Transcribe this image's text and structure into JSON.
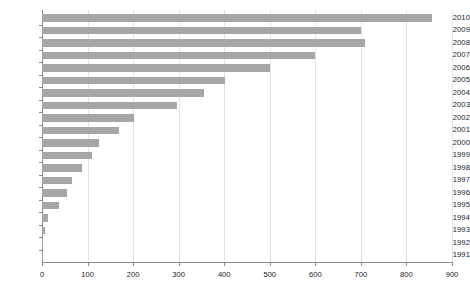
{
  "chart_data": {
    "type": "bar",
    "orientation": "horizontal",
    "title": "",
    "subtitle": "",
    "xlabel": "",
    "ylabel": "",
    "categories": [
      "2010",
      "2009",
      "2008",
      "2007",
      "2006",
      "2005",
      "2004",
      "2003",
      "2002",
      "2001",
      "2000",
      "1999",
      "1998",
      "1997",
      "1996",
      "1995",
      "1994",
      "1993",
      "1992",
      "1991"
    ],
    "values": [
      855,
      700,
      710,
      600,
      500,
      402,
      356,
      297,
      202,
      169,
      125,
      110,
      88,
      66,
      55,
      37,
      13,
      7,
      1,
      1
    ],
    "series": [
      {
        "name": "",
        "values": [
          855,
          700,
          710,
          600,
          500,
          402,
          356,
          297,
          202,
          169,
          125,
          110,
          88,
          66,
          55,
          37,
          13,
          7,
          1,
          1
        ]
      }
    ],
    "xlim": [
      0,
      900
    ],
    "xticks": [
      0,
      100,
      200,
      300,
      400,
      500,
      600,
      700,
      800,
      900
    ],
    "xtick_labels": [
      "0",
      "100",
      "200",
      "300",
      "400",
      "500",
      "600",
      "700",
      "800",
      "900"
    ],
    "grid": "vertical",
    "legend": "none",
    "bar_color": "#a6a6a6",
    "axis_color": "#8a8a8a",
    "grid_color": "#e2e2e2",
    "text_color": "#1a1a1a"
  }
}
